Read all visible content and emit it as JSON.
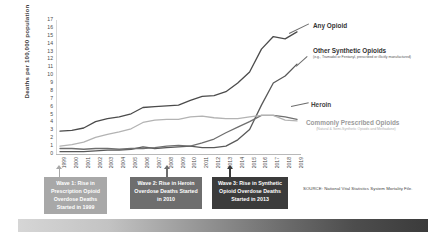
{
  "chart_data": {
    "type": "line",
    "title": "",
    "xlabel": "",
    "ylabel": "Deaths per 100,000 population",
    "ylim": [
      0,
      17
    ],
    "yticks": [
      0,
      1,
      2,
      3,
      4,
      5,
      6,
      7,
      8,
      9,
      10,
      11,
      12,
      13,
      14,
      15,
      16,
      17
    ],
    "grid": false,
    "legend_position": "right-inline",
    "categories": [
      "1999",
      "2000",
      "2001",
      "2002",
      "2003",
      "2004",
      "2005",
      "2006",
      "2007",
      "2008",
      "2009",
      "2010",
      "2011",
      "2012",
      "2013",
      "2014",
      "2015",
      "2016",
      "2017",
      "2018",
      "2019"
    ],
    "series": [
      {
        "name": "Any Opioid",
        "sub": "",
        "color": "#4b4b4b",
        "values": [
          2.9,
          3.0,
          3.3,
          4.1,
          4.5,
          4.7,
          5.1,
          5.9,
          6.0,
          6.1,
          6.2,
          6.8,
          7.3,
          7.4,
          7.9,
          9.0,
          10.4,
          13.3,
          14.9,
          14.6,
          15.5
        ]
      },
      {
        "name": "Other Synthetic Opioids",
        "sub": "(e.g., Tramadol or Fentanyl, prescribed or illicitly manufactured)",
        "color": "#595959",
        "values": [
          0.3,
          0.3,
          0.3,
          0.4,
          0.5,
          0.5,
          0.6,
          0.9,
          0.7,
          0.8,
          0.9,
          1.0,
          0.8,
          0.8,
          1.0,
          1.8,
          3.1,
          6.2,
          9.0,
          9.9,
          11.4
        ]
      },
      {
        "name": "Heroin",
        "sub": "",
        "color": "#6f6f6f",
        "values": [
          0.7,
          0.7,
          0.6,
          0.7,
          0.7,
          0.6,
          0.7,
          0.7,
          0.8,
          1.0,
          1.1,
          1.0,
          1.4,
          1.9,
          2.7,
          3.4,
          4.1,
          4.9,
          4.9,
          4.7,
          4.4
        ]
      },
      {
        "name": "Commonly Prescribed Opioids",
        "sub": "(Natural & Semi-Synthetic Opioids and Methadone)",
        "color": "#b3b3b3",
        "values": [
          1.0,
          1.2,
          1.5,
          2.1,
          2.5,
          2.8,
          3.2,
          4.0,
          4.3,
          4.4,
          4.4,
          4.7,
          4.8,
          4.6,
          4.5,
          4.5,
          4.7,
          4.9,
          4.9,
          4.3,
          4.2
        ]
      }
    ]
  },
  "waves": [
    {
      "label": "Wave 1: Rise in Prescription Opioid Overdose Deaths Started in 1999",
      "color": "#a8a8a8"
    },
    {
      "label": "Wave 2: Rise in Heroin Overdose Deaths Started in 2010",
      "color": "#6e6e6e"
    },
    {
      "label": "Wave 3: Rise in Synthetic Opioid Overdose Deaths Started in 2013",
      "color": "#3b3b3b"
    }
  ],
  "source": "SOURCE: National Vital Statistics System Mortality File."
}
